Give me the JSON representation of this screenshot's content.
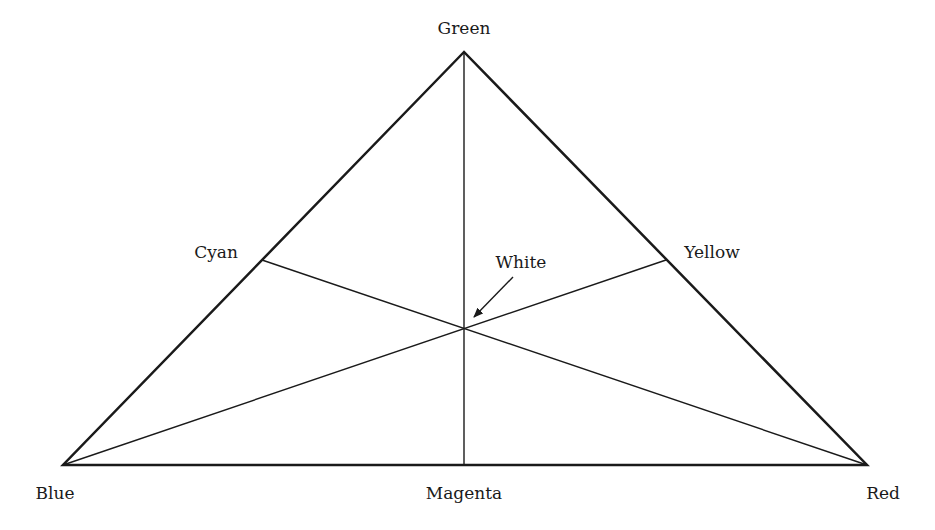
{
  "diagram": {
    "type": "color-triangle",
    "vertices": {
      "top": {
        "label": "Green",
        "x": 464,
        "y": 52
      },
      "bottom_left": {
        "label": "Blue",
        "x": 63,
        "y": 465
      },
      "bottom_right": {
        "label": "Red",
        "x": 867,
        "y": 465
      }
    },
    "midpoints": {
      "left": {
        "label": "Cyan",
        "x": 262,
        "y": 260
      },
      "right": {
        "label": "Yellow",
        "x": 666,
        "y": 260
      },
      "bottom": {
        "label": "Magenta",
        "x": 464,
        "y": 465
      }
    },
    "center": {
      "label": "White",
      "x": 464,
      "y": 327
    },
    "colors": {
      "line": "#1a1a1a",
      "background": "#ffffff"
    }
  }
}
